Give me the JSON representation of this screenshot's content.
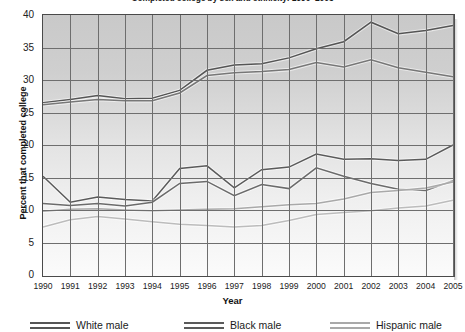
{
  "chart_data": {
    "type": "line",
    "title": "Completed college by sex and ethnicity: 1990–2005",
    "xlabel": "Year",
    "ylabel": "Percent that completed college",
    "xlim": [
      1990,
      2005
    ],
    "ylim": [
      0,
      40
    ],
    "ytick_labels": [
      "0",
      "5",
      "10",
      "15",
      "20",
      "25",
      "30",
      "35",
      "40"
    ],
    "yticks": [
      0,
      5,
      10,
      15,
      20,
      25,
      30,
      35,
      40
    ],
    "grid": true,
    "legend_position": "bottom",
    "categories": [
      "1990",
      "1991",
      "1992",
      "1993",
      "1994",
      "1995",
      "1996",
      "1997",
      "1998",
      "1999",
      "2000",
      "2001",
      "2002",
      "2003",
      "2004",
      "2005"
    ],
    "x": [
      1990,
      1991,
      1992,
      1993,
      1994,
      1995,
      1996,
      1997,
      1998,
      1999,
      2000,
      2001,
      2002,
      2003,
      2004,
      2005
    ],
    "series": [
      {
        "name": "White male",
        "color": "#555555",
        "band": "upper",
        "values": [
          26.5,
          27.0,
          27.6,
          27.1,
          27.2,
          28.4,
          31.5,
          32.3,
          32.5,
          33.4,
          34.8,
          35.9,
          38.9,
          37.1,
          37.6,
          38.4
        ]
      },
      {
        "name": "White male (lower bound)",
        "color": "#777777",
        "band": "upper",
        "values": [
          26.2,
          26.6,
          27.0,
          26.8,
          26.8,
          28.0,
          30.7,
          31.1,
          31.3,
          31.6,
          32.7,
          32.0,
          33.1,
          31.9,
          31.2,
          30.5
        ]
      },
      {
        "name": "Black male",
        "color": "#5a5a5a",
        "band": "middle",
        "values": [
          15.2,
          11.2,
          12.0,
          11.6,
          11.4,
          16.4,
          16.8,
          13.4,
          16.2,
          16.6,
          18.6,
          17.8,
          17.9,
          17.6,
          17.8,
          20.0
        ]
      },
      {
        "name": "Black male (lower bound)",
        "color": "#6b6b6b",
        "band": "middle",
        "values": [
          11.0,
          10.7,
          11.0,
          10.6,
          11.2,
          14.1,
          14.4,
          12.2,
          13.9,
          13.3,
          16.5,
          15.2,
          14.1,
          13.2,
          13.0,
          14.5
        ]
      },
      {
        "name": "Hispanic male",
        "color": "#a9a9a9",
        "band": "lower",
        "values": [
          9.8,
          10.1,
          10.2,
          10.0,
          9.9,
          10.0,
          10.1,
          10.2,
          10.5,
          10.8,
          11.0,
          11.7,
          12.7,
          13.0,
          13.4,
          14.3
        ]
      },
      {
        "name": "Hispanic male (lower bound)",
        "color": "#bcbcbc",
        "band": "lower",
        "values": [
          7.4,
          8.5,
          9.0,
          8.6,
          8.2,
          7.8,
          7.6,
          7.4,
          7.6,
          8.4,
          9.3,
          9.6,
          9.9,
          10.3,
          10.6,
          11.5
        ]
      }
    ],
    "legend": [
      {
        "label": "White male",
        "color": "#555555"
      },
      {
        "label": "Black male",
        "color": "#5a5a5a"
      },
      {
        "label": "Hispanic male",
        "color": "#a9a9a9"
      }
    ]
  }
}
